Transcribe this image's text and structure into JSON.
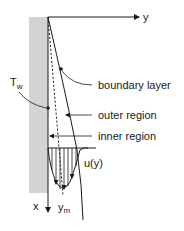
{
  "diagram": {
    "labels": {
      "y_axis": "y",
      "x_axis": "x",
      "wall_temperature": "T",
      "wall_temperature_sub": "w",
      "boundary_layer": "boundary layer",
      "outer_region": "outer region",
      "inner_region": "inner region",
      "velocity_profile": "u(y)",
      "max_velocity_location": "y",
      "max_velocity_location_sub": "m"
    },
    "colors": {
      "wall": "#d3d3d3",
      "line": "#1a1a1a"
    }
  }
}
